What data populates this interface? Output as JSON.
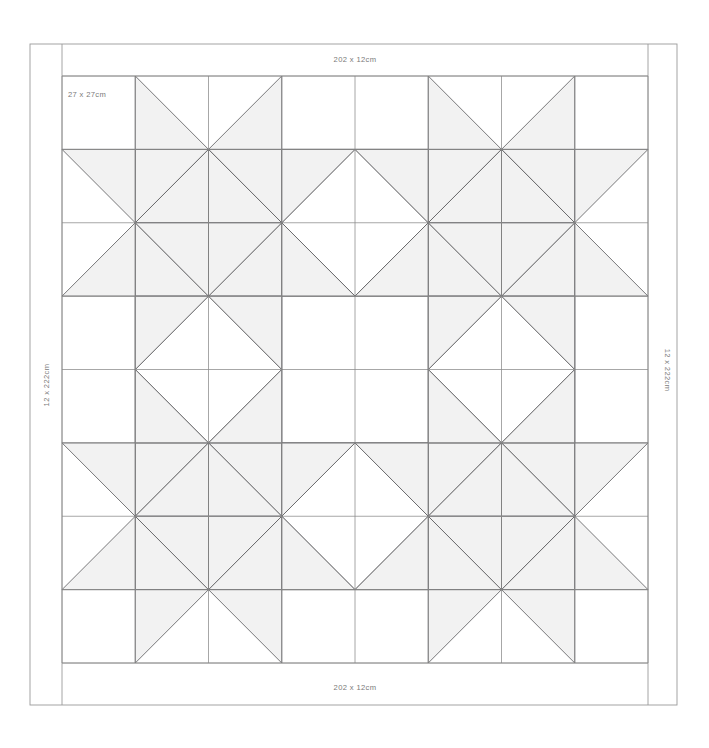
{
  "diagram": {
    "kind": "quilt-layout-diagram",
    "colors": {
      "background": "#ffffff",
      "patch_fill": "#f2f2f2",
      "patch_stroke": "#58585a",
      "grid_stroke": "#8a8a8a",
      "border_stroke": "#9a9a9a",
      "label_text": "#7a7a7a"
    },
    "labels": {
      "top_border": "202 x 12cm",
      "bottom_border": "202 x 12cm",
      "left_border": "12 x 222cm",
      "right_border": "12 x 222cm",
      "block_size": "27 x 27cm"
    },
    "geometry": {
      "outer_frame": {
        "x": 30,
        "y": 44,
        "width": 647,
        "height": 661
      },
      "inner_field": {
        "x": 62,
        "y": 76,
        "width": 586,
        "height": 587
      },
      "grid_cols": 8,
      "grid_rows": 8,
      "cell_width": 73.25,
      "cell_height": 73.375,
      "top_border_band": {
        "y": 44,
        "height": 32
      },
      "bottom_border_band": {
        "y": 663,
        "height": 42
      },
      "left_border_band": {
        "x": 30,
        "width": 32
      },
      "right_border_band": {
        "x": 648,
        "width": 29
      }
    },
    "blocks": {
      "star_block_centers": [
        {
          "col": 2,
          "row": 2
        },
        {
          "col": 6,
          "row": 2
        },
        {
          "col": 2,
          "row": 6
        },
        {
          "col": 6,
          "row": 6
        }
      ],
      "square_in_square_centers": [
        {
          "col": 4,
          "row": 2
        },
        {
          "col": 4,
          "row": 6
        },
        {
          "col": 2,
          "row": 4
        },
        {
          "col": 6,
          "row": 4
        }
      ],
      "star_points_per_block": 8,
      "block_span_cells": 4
    }
  }
}
